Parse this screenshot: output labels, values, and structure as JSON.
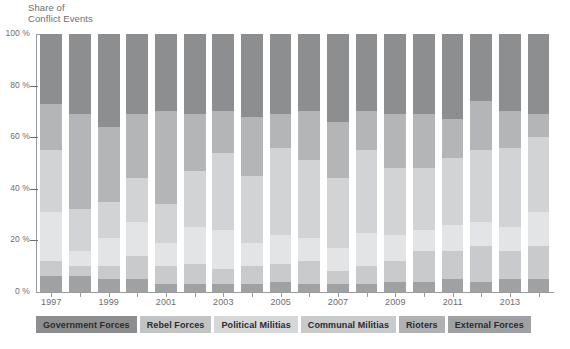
{
  "chart_data": {
    "type": "bar",
    "subtype": "stacked-percentage-column",
    "title": "",
    "xlabel": "",
    "ylabel": "Share of\nConflict Events",
    "ylim": [
      0,
      100
    ],
    "ytick_labels": [
      "0 %",
      "20 %",
      "40 %",
      "60 %",
      "80 %",
      "100 %"
    ],
    "ytick_values": [
      0,
      20,
      40,
      60,
      80,
      100
    ],
    "grid": false,
    "legend_position": "bottom",
    "categories": [
      "1997",
      "1998",
      "1999",
      "2000",
      "2001",
      "2002",
      "2003",
      "2004",
      "2005",
      "2006",
      "2007",
      "2008",
      "2009",
      "2010",
      "2011",
      "2012",
      "2013",
      "2014"
    ],
    "xtick_labels_shown": [
      "1997",
      "1999",
      "2001",
      "2003",
      "2005",
      "2007",
      "2009",
      "2011",
      "2013"
    ],
    "series": [
      {
        "name": "Government Forces",
        "color": "#8d8e90",
        "values": [
          27,
          31,
          36,
          31,
          30,
          31,
          30,
          32,
          31,
          30,
          34,
          30,
          31,
          31,
          33,
          26,
          30,
          31
        ]
      },
      {
        "name": "Rebel Forces",
        "color": "#b4b5b7",
        "values": [
          18,
          37,
          29,
          25,
          36,
          22,
          16,
          23,
          13,
          19,
          22,
          15,
          21,
          21,
          15,
          19,
          14,
          9
        ]
      },
      {
        "name": "Political Militias",
        "color": "#d2d3d4",
        "values": [
          24,
          16,
          14,
          17,
          15,
          22,
          30,
          26,
          34,
          30,
          27,
          32,
          26,
          24,
          26,
          28,
          31,
          29
        ]
      },
      {
        "name": "Communal Militias",
        "color": "#e3e4e5",
        "values": [
          19,
          6,
          11,
          13,
          9,
          14,
          15,
          9,
          11,
          9,
          9,
          13,
          10,
          8,
          10,
          9,
          9,
          13
        ]
      },
      {
        "name": "Rioters",
        "color": "#c9cacb",
        "values": [
          6,
          4,
          5,
          9,
          7,
          8,
          6,
          7,
          7,
          9,
          5,
          7,
          8,
          12,
          11,
          14,
          11,
          13
        ]
      },
      {
        "name": "External Forces",
        "color": "#a0a1a3",
        "values": [
          6,
          6,
          5,
          5,
          3,
          3,
          3,
          3,
          4,
          3,
          3,
          3,
          4,
          4,
          5,
          4,
          5,
          5
        ]
      }
    ]
  },
  "legend": {
    "items": [
      {
        "label": "Government Forces",
        "color": "#8d8e90"
      },
      {
        "label": "Rebel Forces",
        "color": "#c2c3c4"
      },
      {
        "label": "Political Militias",
        "color": "#d6d7d8"
      },
      {
        "label": "Communal Militias",
        "color": "#c9cacb"
      },
      {
        "label": "Rioters",
        "color": "#b0b1b3"
      },
      {
        "label": "External Forces",
        "color": "#a0a1a3"
      }
    ]
  }
}
